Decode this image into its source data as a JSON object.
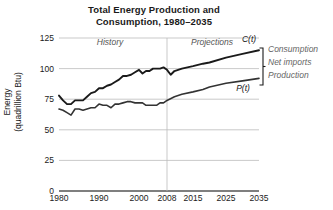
{
  "chart_data": {
    "type": "line",
    "title": "Total Energy Production and Consumption, 1980–2035",
    "title_line1": "Total Energy Production and",
    "title_line2": "Consumption, 1980–2035",
    "xlabel": "",
    "ylabel": "Energy",
    "ylabel_line1": "Energy",
    "ylabel_line2": "(quadrillion Btu)",
    "ylabel_full": "Energy (quadrillion Btu)",
    "xlim": [
      1980,
      2035
    ],
    "ylim": [
      0,
      125
    ],
    "yticks": [
      0,
      25,
      50,
      75,
      100,
      125
    ],
    "ytick_labels": [
      "0",
      "25",
      "50",
      "75",
      "100",
      "125"
    ],
    "xticks": [
      1980,
      1990,
      2000,
      2008,
      2015,
      2025,
      2035
    ],
    "xtick_labels": [
      "1980",
      "1990",
      "2000",
      "2008",
      "2015",
      "2025",
      "2035"
    ],
    "grid": "horizontal",
    "legend_position": "right-bracket",
    "divider_year": 2008,
    "annotations": [
      {
        "name": "history",
        "text": "History",
        "x": 1991,
        "y": 120
      },
      {
        "name": "projections",
        "text": "Projections",
        "x": 2017,
        "y": 120
      }
    ],
    "legend_entries": [
      "Consumption",
      "Net imports",
      "Production"
    ],
    "series": [
      {
        "name": "C(t)",
        "label": "C(t)",
        "description": "Consumption",
        "color": "#1a1a1a",
        "x": [
          1980,
          1981,
          1982,
          1983,
          1984,
          1985,
          1986,
          1987,
          1988,
          1989,
          1990,
          1991,
          1992,
          1993,
          1994,
          1995,
          1996,
          1997,
          1998,
          1999,
          2000,
          2001,
          2002,
          2003,
          2004,
          2005,
          2006,
          2007,
          2008,
          2009,
          2010,
          2012,
          2015,
          2018,
          2020,
          2025,
          2030,
          2035
        ],
        "values": [
          78,
          74,
          71,
          71,
          74,
          74,
          74,
          77,
          80,
          81,
          84,
          84,
          86,
          87,
          89,
          91,
          94,
          94,
          95,
          97,
          99,
          96,
          98,
          98,
          100,
          100,
          100,
          101,
          99,
          95,
          98,
          100,
          102,
          104,
          105,
          109,
          112,
          115
        ]
      },
      {
        "name": "P(t)",
        "label": "P(t)",
        "description": "Production",
        "color": "#333333",
        "x": [
          1980,
          1981,
          1982,
          1983,
          1984,
          1985,
          1986,
          1987,
          1988,
          1989,
          1990,
          1991,
          1992,
          1993,
          1994,
          1995,
          1996,
          1997,
          1998,
          1999,
          2000,
          2001,
          2002,
          2003,
          2004,
          2005,
          2006,
          2007,
          2008,
          2010,
          2012,
          2015,
          2018,
          2020,
          2025,
          2030,
          2035
        ],
        "values": [
          67,
          66,
          64,
          62,
          67,
          67,
          66,
          67,
          68,
          68,
          71,
          70,
          70,
          68,
          71,
          71,
          72,
          73,
          73,
          72,
          72,
          72,
          70,
          70,
          70,
          70,
          72,
          72,
          74,
          77,
          79,
          81,
          83,
          85,
          88,
          90,
          92
        ]
      }
    ]
  },
  "style": {
    "axis_color": "#444444",
    "grid_color": "#bbbbbb",
    "text_color": "#1a1a1a",
    "annotation_color": "#555555",
    "legend_color": "#666666",
    "background": "#ffffff"
  }
}
